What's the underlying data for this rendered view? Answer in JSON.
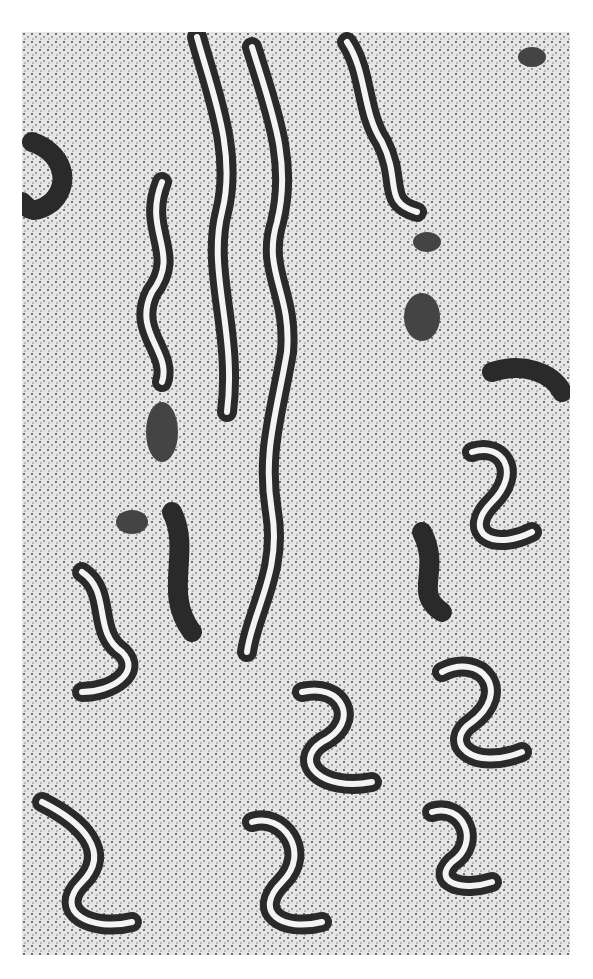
{
  "image": {
    "subject": "histology micrograph",
    "description": "Grayscale light micrograph of tissue showing numerous tortuous, serpentine glands lined by dark columnar epithelium set in dense cellular stroma",
    "colors": {
      "background": "#ffffff",
      "stroma": "#d9d9d9",
      "epithelium": "#2a2a2a",
      "lumen": "#f4f4f4"
    }
  }
}
